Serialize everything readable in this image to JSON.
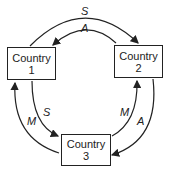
{
  "diagram": {
    "nodes": [
      {
        "id": "c1",
        "line1": "Country",
        "line2": "1"
      },
      {
        "id": "c2",
        "line1": "Country",
        "line2": "2"
      },
      {
        "id": "c3",
        "line1": "Country",
        "line2": "3"
      }
    ],
    "edges": [
      {
        "from": "c1",
        "to": "c2",
        "label": "S"
      },
      {
        "from": "c2",
        "to": "c1",
        "label": "A"
      },
      {
        "from": "c1",
        "to": "c3",
        "label": "S"
      },
      {
        "from": "c3",
        "to": "c1",
        "label": "M"
      },
      {
        "from": "c3",
        "to": "c2",
        "label": "M"
      },
      {
        "from": "c2",
        "to": "c3",
        "label": "A"
      }
    ]
  }
}
